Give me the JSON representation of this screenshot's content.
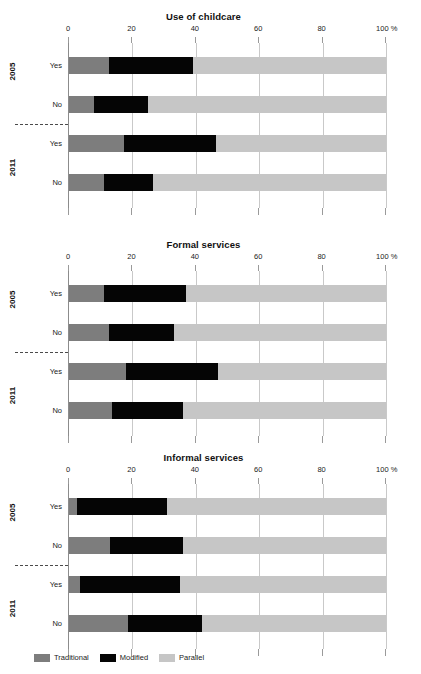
{
  "colors": {
    "traditional": "#7d7d7d",
    "modified": "#050505",
    "parallel": "#c6c6c6",
    "gridline": "#c9c9c9",
    "axis": "#8c8c8c"
  },
  "legend": {
    "position": "bottom-left",
    "items": [
      {
        "key": "traditional",
        "label": "Traditional",
        "color": "#7d7d7d"
      },
      {
        "key": "modified",
        "label": "Modified",
        "color": "#050505"
      },
      {
        "key": "parallel",
        "label": "Parallel",
        "color": "#c6c6c6"
      }
    ]
  },
  "axis": {
    "ticks": [
      0,
      20,
      40,
      60,
      80,
      100
    ],
    "tick_labels": [
      "0",
      "20",
      "40",
      "60",
      "80",
      "100 %"
    ],
    "xlim": [
      0,
      100
    ],
    "unit": "%"
  },
  "groups": [
    {
      "label": "2005",
      "rows": [
        "Yes",
        "No"
      ]
    },
    {
      "label": "2011",
      "rows": [
        "Yes",
        "No"
      ]
    }
  ],
  "chart_data": [
    {
      "type": "bar",
      "orientation": "horizontal",
      "stacked": true,
      "normalized": true,
      "title": "Use of childcare",
      "xlabel": "",
      "ylabel": "",
      "xlim": [
        0,
        100
      ],
      "xticks": [
        0,
        20,
        40,
        60,
        80,
        100
      ],
      "xtick_labels": [
        "0",
        "20",
        "40",
        "60",
        "80",
        "100 %"
      ],
      "grid": true,
      "legend_position": "bottom-left",
      "categories": [
        "2005 Yes",
        "2005 No",
        "2011 Yes",
        "2011 No"
      ],
      "series": [
        {
          "name": "Traditional",
          "values": [
            12.5,
            8.0,
            17.5,
            11.0
          ]
        },
        {
          "name": "Modified",
          "values": [
            26.5,
            17.0,
            29.0,
            15.5
          ]
        },
        {
          "name": "Parallel",
          "values": [
            61.0,
            75.0,
            53.5,
            73.5
          ]
        }
      ],
      "cumulative_boundaries": [
        [
          12.5,
          39.0,
          100
        ],
        [
          8.0,
          25.0,
          100
        ],
        [
          17.5,
          46.5,
          100
        ],
        [
          11.0,
          26.5,
          100
        ]
      ]
    },
    {
      "type": "bar",
      "orientation": "horizontal",
      "stacked": true,
      "normalized": true,
      "title": "Formal services",
      "xlabel": "",
      "ylabel": "",
      "xlim": [
        0,
        100
      ],
      "xticks": [
        0,
        20,
        40,
        60,
        80,
        100
      ],
      "xtick_labels": [
        "0",
        "20",
        "40",
        "60",
        "80",
        "100 %"
      ],
      "grid": true,
      "legend_position": "bottom-left",
      "categories": [
        "2005 Yes",
        "2005 No",
        "2011 Yes",
        "2011 No"
      ],
      "series": [
        {
          "name": "Traditional",
          "values": [
            11.0,
            12.5,
            18.0,
            13.5
          ]
        },
        {
          "name": "Modified",
          "values": [
            26.0,
            20.5,
            29.0,
            22.5
          ]
        },
        {
          "name": "Parallel",
          "values": [
            63.0,
            67.0,
            53.0,
            64.0
          ]
        }
      ],
      "cumulative_boundaries": [
        [
          11.0,
          37.0,
          100
        ],
        [
          12.5,
          33.0,
          100
        ],
        [
          18.0,
          47.0,
          100
        ],
        [
          13.5,
          36.0,
          100
        ]
      ]
    },
    {
      "type": "bar",
      "orientation": "horizontal",
      "stacked": true,
      "normalized": true,
      "title": "Informal services",
      "xlabel": "",
      "ylabel": "",
      "xlim": [
        0,
        100
      ],
      "xticks": [
        0,
        20,
        40,
        60,
        80,
        100
      ],
      "xtick_labels": [
        "0",
        "20",
        "40",
        "60",
        "80",
        "100 %"
      ],
      "grid": true,
      "legend_position": "bottom-left",
      "categories": [
        "2005 Yes",
        "2005 No",
        "2011 Yes",
        "2011 No"
      ],
      "series": [
        {
          "name": "Traditional",
          "values": [
            2.5,
            13.0,
            3.5,
            18.5
          ]
        },
        {
          "name": "Modified",
          "values": [
            28.5,
            23.0,
            31.5,
            23.5
          ]
        },
        {
          "name": "Parallel",
          "values": [
            69.0,
            64.0,
            65.0,
            58.0
          ]
        }
      ],
      "cumulative_boundaries": [
        [
          2.5,
          31.0,
          100
        ],
        [
          13.0,
          36.0,
          100
        ],
        [
          3.5,
          35.0,
          100
        ],
        [
          18.5,
          42.0,
          100
        ]
      ]
    }
  ]
}
